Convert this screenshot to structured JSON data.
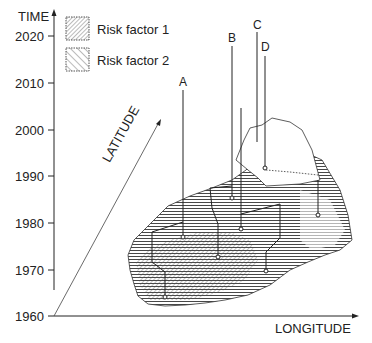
{
  "axes": {
    "y_label": "TIME",
    "x_label": "LONGITUDE",
    "diagonal_label": "LATITUDE",
    "y_ticks": [
      "2020",
      "2010",
      "2000",
      "1990",
      "1980",
      "1970",
      "1960"
    ]
  },
  "legend": [
    {
      "label": "Risk factor 1",
      "pattern": "fine-diagonal-hatch"
    },
    {
      "label": "Risk factor 2",
      "pattern": "coarse-diagonal-hatch"
    }
  ],
  "points": [
    {
      "label": "A"
    },
    {
      "label": "B"
    },
    {
      "label": "C"
    },
    {
      "label": "D"
    }
  ],
  "colors": {
    "ink": "#222222",
    "background": "#ffffff"
  }
}
